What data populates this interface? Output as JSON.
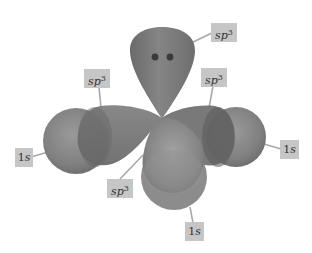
{
  "diagram": {
    "type": "orbital-hybridization",
    "colors": {
      "background": "#ffffff",
      "lobe_fill": "#7a7a7a",
      "lobe_dark": "#5e5e5e",
      "sphere_fill": "#8a8a8a",
      "label_bg": "#c6c6c6",
      "label_text": "#333333",
      "leader_line": "#a8a8a8",
      "electron_dot": "#3a3a3a"
    },
    "lone_pair": {
      "dots": 2
    },
    "labels": [
      {
        "id": "sp3-top",
        "base": "sp",
        "sup": "3"
      },
      {
        "id": "sp3-left",
        "base": "sp",
        "sup": "3"
      },
      {
        "id": "sp3-right",
        "base": "sp",
        "sup": "3"
      },
      {
        "id": "sp3-bottom-left",
        "base": "sp",
        "sup": "3"
      },
      {
        "id": "1s-left",
        "base": "1",
        "italic": "s"
      },
      {
        "id": "1s-right",
        "base": "1",
        "italic": "s"
      },
      {
        "id": "1s-bottom",
        "base": "1",
        "italic": "s"
      }
    ]
  }
}
